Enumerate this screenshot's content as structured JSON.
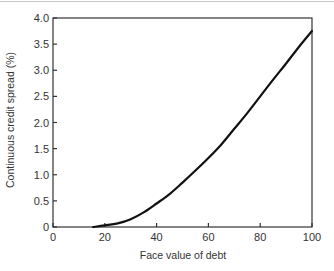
{
  "chart_data": {
    "type": "line",
    "title": "",
    "xlabel": "Face value of debt",
    "ylabel": "Continuous credit spread (%)",
    "xlim": [
      0,
      100
    ],
    "ylim": [
      0,
      4.0
    ],
    "x_ticks": [
      0,
      20,
      40,
      60,
      80,
      100
    ],
    "x_tick_labels": [
      "0",
      "20",
      "40",
      "60",
      "80",
      "100"
    ],
    "y_ticks": [
      0,
      0.5,
      1.0,
      1.5,
      2.0,
      2.5,
      3.0,
      3.5,
      4.0
    ],
    "y_tick_labels": [
      "0",
      "0.5",
      "1.0",
      "1.5",
      "2.0",
      "2.5",
      "3.0",
      "3.5",
      "4.0"
    ],
    "grid": false,
    "legend": null,
    "series": [
      {
        "name": "Credit spread",
        "color": "#111111",
        "x": [
          15.5,
          20,
          25,
          30,
          35,
          40,
          45,
          50,
          55,
          60,
          65,
          70,
          75,
          80,
          85,
          90,
          95,
          100
        ],
        "y": [
          0.0,
          0.03,
          0.07,
          0.15,
          0.28,
          0.45,
          0.63,
          0.85,
          1.08,
          1.32,
          1.58,
          1.88,
          2.18,
          2.5,
          2.82,
          3.13,
          3.45,
          3.75
        ]
      }
    ]
  },
  "plot": {
    "frame_color": "#333333",
    "line_color": "#111111"
  }
}
